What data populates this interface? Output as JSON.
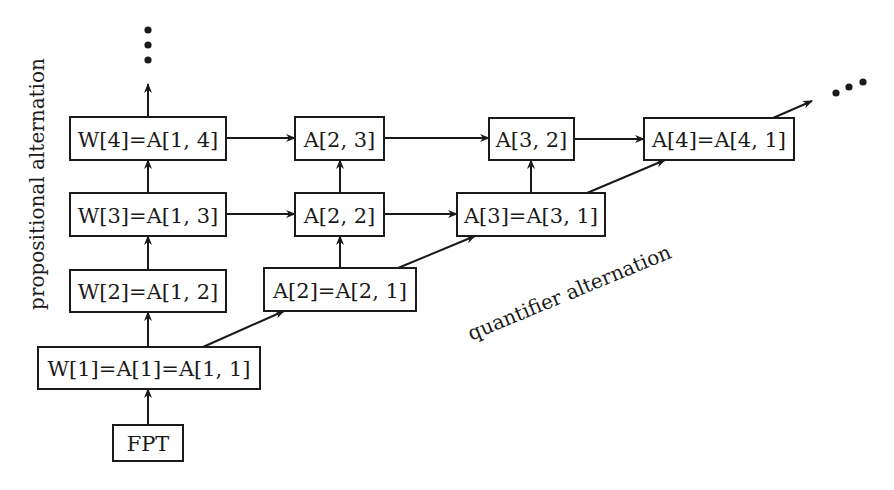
{
  "diagram": {
    "title": "",
    "labels": {
      "vertical_axis": "propositional alternation",
      "diagonal_axis": "quantifier alternation"
    },
    "nodes": [
      {
        "id": "fpt",
        "label": "FPT",
        "x": 113,
        "y": 425,
        "w": 70,
        "h": 36
      },
      {
        "id": "w1",
        "label": "W[1]=A[1]=A[1, 1]",
        "x": 38,
        "y": 347,
        "w": 222,
        "h": 42
      },
      {
        "id": "w2",
        "label": "W[2]=A[1, 2]",
        "x": 70,
        "y": 270,
        "w": 156,
        "h": 42
      },
      {
        "id": "w3",
        "label": "W[3]=A[1, 3]",
        "x": 70,
        "y": 193,
        "w": 156,
        "h": 43
      },
      {
        "id": "w4",
        "label": "W[4]=A[1, 4]",
        "x": 70,
        "y": 117,
        "w": 156,
        "h": 43
      },
      {
        "id": "a2",
        "label": "A[2]=A[2, 1]",
        "x": 264,
        "y": 268,
        "w": 152,
        "h": 43
      },
      {
        "id": "a22",
        "label": "A[2, 2]",
        "x": 295,
        "y": 193,
        "w": 89,
        "h": 43
      },
      {
        "id": "a23",
        "label": "A[2, 3]",
        "x": 295,
        "y": 117,
        "w": 89,
        "h": 43
      },
      {
        "id": "a3",
        "label": "A[3]=A[3, 1]",
        "x": 457,
        "y": 193,
        "w": 148,
        "h": 43
      },
      {
        "id": "a32",
        "label": "A[3, 2]",
        "x": 489,
        "y": 118,
        "w": 85,
        "h": 42
      },
      {
        "id": "a4",
        "label": "A[4]=A[4, 1]",
        "x": 644,
        "y": 118,
        "w": 150,
        "h": 42
      }
    ],
    "edges": [
      {
        "from": "fpt",
        "to": "w1",
        "x1": 148,
        "y1": 425,
        "x2": 148,
        "y2": 389
      },
      {
        "from": "w1",
        "to": "w2",
        "x1": 148,
        "y1": 347,
        "x2": 148,
        "y2": 312
      },
      {
        "from": "w2",
        "to": "w3",
        "x1": 148,
        "y1": 270,
        "x2": 148,
        "y2": 236
      },
      {
        "from": "w3",
        "to": "w4",
        "x1": 148,
        "y1": 193,
        "x2": 148,
        "y2": 160
      },
      {
        "from": "w4",
        "to": "continuation-up",
        "x1": 148,
        "y1": 117,
        "x2": 148,
        "y2": 84
      },
      {
        "from": "w4",
        "to": "a23",
        "x1": 226,
        "y1": 138,
        "x2": 295,
        "y2": 138
      },
      {
        "from": "w3",
        "to": "a22",
        "x1": 226,
        "y1": 214,
        "x2": 295,
        "y2": 214
      },
      {
        "from": "w1",
        "to": "a2",
        "x1": 203,
        "y1": 347,
        "x2": 284,
        "y2": 311
      },
      {
        "from": "a2",
        "to": "a22",
        "x1": 340,
        "y1": 268,
        "x2": 340,
        "y2": 236
      },
      {
        "from": "a22",
        "to": "a23",
        "x1": 340,
        "y1": 193,
        "x2": 340,
        "y2": 160
      },
      {
        "from": "a23",
        "to": "a32",
        "x1": 384,
        "y1": 138,
        "x2": 489,
        "y2": 138
      },
      {
        "from": "a22",
        "to": "a3",
        "x1": 384,
        "y1": 214,
        "x2": 457,
        "y2": 214
      },
      {
        "from": "a2",
        "to": "a3",
        "x1": 398,
        "y1": 268,
        "x2": 475,
        "y2": 236
      },
      {
        "from": "a3",
        "to": "a32",
        "x1": 531,
        "y1": 193,
        "x2": 531,
        "y2": 160
      },
      {
        "from": "a32",
        "to": "a4",
        "x1": 574,
        "y1": 139,
        "x2": 644,
        "y2": 139
      },
      {
        "from": "a3",
        "to": "a4",
        "x1": 587,
        "y1": 193,
        "x2": 665,
        "y2": 160
      },
      {
        "from": "a4",
        "to": "continuation-diagonal",
        "x1": 773,
        "y1": 118,
        "x2": 812,
        "y2": 101
      }
    ],
    "ellipses": {
      "vertical": [
        {
          "cx": 148,
          "cy": 30
        },
        {
          "cx": 148,
          "cy": 45
        },
        {
          "cx": 148,
          "cy": 60
        }
      ],
      "diagonal": [
        {
          "cx": 836,
          "cy": 93
        },
        {
          "cx": 849,
          "cy": 87
        },
        {
          "cx": 863,
          "cy": 82
        }
      ]
    },
    "colors": {
      "stroke": "#1a1a1a",
      "background": "#ffffff"
    }
  }
}
